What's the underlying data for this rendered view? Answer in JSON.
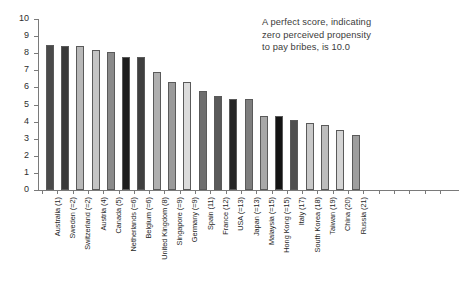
{
  "annotation": {
    "line1": "A perfect score, indicating",
    "line2": "zero perceived propensity",
    "line3": "to pay bribes, is 10.0"
  },
  "chart_data": {
    "type": "bar",
    "title": "",
    "xlabel": "",
    "ylabel": "",
    "ylim": [
      0,
      10
    ],
    "yticks": [
      0,
      1,
      2,
      3,
      4,
      5,
      6,
      7,
      8,
      9,
      10
    ],
    "ytick_labels": [
      "0",
      "1",
      "2",
      "3",
      "4",
      "5",
      "6",
      "7",
      "8",
      "9",
      "10"
    ],
    "grid": false,
    "legend": "none",
    "categories": [
      "Australia (1)",
      "Sweden (=2)",
      "Switzerland (=2)",
      "Austria (4)",
      "Canada (5)",
      "Netherlands (=6)",
      "Belgium (=6)",
      "United Kingdom (8)",
      "Singapore (=9)",
      "Germany (=9)",
      "Spain (11)",
      "France (12)",
      "USA (=13)",
      "Japan (=13)",
      "Malaysia (=15)",
      "Hong Kong (=15)",
      "Italy (17)",
      "South Korea (18)",
      "Taiwan (19)",
      "China (20)",
      "Russia (21)"
    ],
    "values": [
      8.5,
      8.4,
      8.4,
      8.2,
      8.1,
      7.8,
      7.8,
      6.9,
      6.3,
      6.3,
      5.8,
      5.5,
      5.3,
      5.3,
      4.3,
      4.3,
      4.1,
      3.9,
      3.8,
      3.5,
      3.2
    ],
    "bar_colors": [
      "#4a4a4a",
      "#3a3a3a",
      "#b8b8b8",
      "#c4c4c4",
      "#8a8a8a",
      "#1e1e1e",
      "#3f3f3f",
      "#b0b0b0",
      "#9a9a9a",
      "#dcdcdc",
      "#6e6e6e",
      "#5a5a5a",
      "#262626",
      "#7e7e7e",
      "#a8a8a8",
      "#141414",
      "#4f4f4f",
      "#c8c8c8",
      "#bdbdbd",
      "#d4d4d4",
      "#9e9e9e"
    ]
  }
}
